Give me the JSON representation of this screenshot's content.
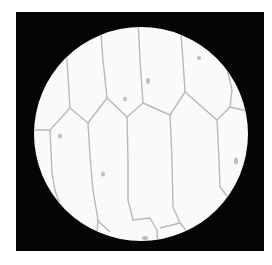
{
  "image": {
    "description": "Light microscope field of view showing elongated polygonal plant epidermal cells (onion-skin-like) inside a circular bright field on a black background",
    "colors": {
      "background": "#ffffff",
      "frame": "#050505",
      "field": "#fafafa",
      "cell_wall": "#b9b9bd",
      "nucleus": "#a9a9b0"
    },
    "field_of_view": {
      "cx": 141,
      "cy": 134,
      "r": 107
    }
  }
}
